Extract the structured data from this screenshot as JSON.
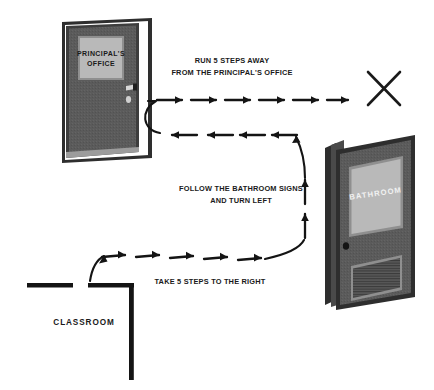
{
  "scene": {
    "title": "Path from classroom to bathroom avoiding the principal's office",
    "background_color": "#ffffff",
    "ink_color": "#1a1a1a"
  },
  "doors": {
    "principal": {
      "name": "principal-office-door",
      "sign_line1": "PRINCIPAL'S",
      "sign_line2": "OFFICE",
      "frame_color": "#3d3d3d",
      "panel_color": "#5b5b5b",
      "sign_color": "#b9b9b9",
      "hardware": [
        "door-handle",
        "door-lock"
      ]
    },
    "bathroom": {
      "name": "bathroom-door",
      "sign_text": "BATHROOM",
      "frame_color": "#3d3d3d",
      "panel_color": "#5b5b5b",
      "window_color": "#b9b9b9",
      "hardware": [
        "door-knob",
        "louver-vent"
      ]
    }
  },
  "rooms": {
    "classroom_label": "CLASSROOM"
  },
  "instructions": [
    {
      "id": "step-1",
      "line1": "TAKE 5 STEPS TO THE RIGHT",
      "line2": "",
      "arrow_count": 5,
      "direction": "right"
    },
    {
      "id": "step-2",
      "line1": "FOLLOW THE BATHROOM SIGNS",
      "line2": "AND TURN LEFT",
      "arrow_count": 2,
      "direction": "up"
    },
    {
      "id": "step-3",
      "line1": "RUN 5 STEPS AWAY",
      "line2": "FROM THE PRINCIPAL'S OFFICE",
      "arrow_count": 6,
      "direction": "right"
    }
  ],
  "arrow_rows": {
    "top_right_row": {
      "count": 6,
      "direction": "right"
    },
    "left_row": {
      "count": 4,
      "direction": "left"
    },
    "bottom_right_row": {
      "count": 5,
      "direction": "right"
    },
    "vertical_row": {
      "count": 2,
      "direction": "up"
    }
  },
  "marks": {
    "x_mark": "X"
  }
}
